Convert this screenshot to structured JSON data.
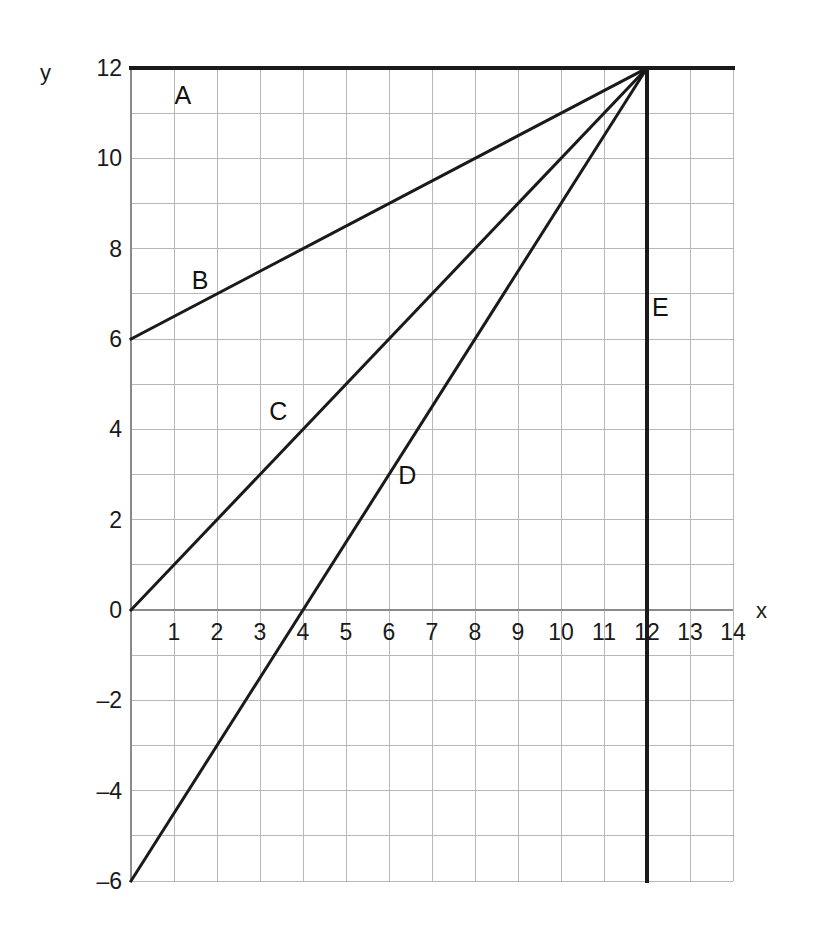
{
  "chart_data": {
    "type": "line",
    "title": "",
    "subtitle": "",
    "xlabel": "x",
    "ylabel": "y",
    "xlim": [
      0,
      14
    ],
    "ylim": [
      -6,
      12
    ],
    "grid": true,
    "grid_step_x": 1,
    "grid_step_y": 1,
    "legend_position": "inline-labels",
    "x_ticks": [
      {
        "value": 1,
        "label": "1"
      },
      {
        "value": 2,
        "label": "2"
      },
      {
        "value": 3,
        "label": "3"
      },
      {
        "value": 4,
        "label": "4"
      },
      {
        "value": 5,
        "label": "5"
      },
      {
        "value": 6,
        "label": "6"
      },
      {
        "value": 7,
        "label": "7"
      },
      {
        "value": 8,
        "label": "8"
      },
      {
        "value": 9,
        "label": "9"
      },
      {
        "value": 10,
        "label": "10"
      },
      {
        "value": 11,
        "label": "11"
      },
      {
        "value": 12,
        "label": "12"
      },
      {
        "value": 13,
        "label": "13"
      },
      {
        "value": 14,
        "label": "14"
      }
    ],
    "y_ticks": [
      {
        "value": 12,
        "label": "12"
      },
      {
        "value": 10,
        "label": "10"
      },
      {
        "value": 8,
        "label": "8"
      },
      {
        "value": 6,
        "label": "6"
      },
      {
        "value": 4,
        "label": "4"
      },
      {
        "value": 2,
        "label": "2"
      },
      {
        "value": 0,
        "label": "0"
      },
      {
        "value": -2,
        "label": "–2"
      },
      {
        "value": -4,
        "label": "–4"
      },
      {
        "value": -6,
        "label": "–6"
      }
    ],
    "series": [
      {
        "name": "A",
        "label": "A",
        "kind": "horizontal",
        "equation": "y = 12",
        "points": [
          [
            0,
            12
          ],
          [
            14,
            12
          ]
        ],
        "label_at": [
          1.2,
          11.4
        ],
        "color": "#1a1a1a",
        "width": 4
      },
      {
        "name": "B",
        "label": "B",
        "kind": "line",
        "equation": "y = 6 + 0.5x",
        "points": [
          [
            0,
            6
          ],
          [
            12,
            12
          ]
        ],
        "label_at": [
          1.6,
          7.3
        ],
        "color": "#1a1a1a",
        "width": 3
      },
      {
        "name": "C",
        "label": "C",
        "kind": "line",
        "equation": "y = x",
        "points": [
          [
            0,
            0
          ],
          [
            12,
            12
          ]
        ],
        "label_at": [
          3.4,
          4.4
        ],
        "color": "#1a1a1a",
        "width": 3
      },
      {
        "name": "D",
        "label": "D",
        "kind": "line",
        "equation": "y = -6 + 1.5x",
        "points": [
          [
            0,
            -6
          ],
          [
            12,
            12
          ]
        ],
        "label_at": [
          6.4,
          3.0
        ],
        "color": "#1a1a1a",
        "width": 3
      },
      {
        "name": "E",
        "label": "E",
        "kind": "vertical",
        "equation": "x = 12",
        "points": [
          [
            12,
            12
          ],
          [
            12,
            -6
          ]
        ],
        "label_at": [
          12.3,
          6.7
        ],
        "color": "#1a1a1a",
        "width": 4
      }
    ],
    "axis_colors": {
      "grid": "#b7b7b7",
      "axis": "#8a8a8a",
      "line": "#1a1a1a",
      "text": "#1a1a1a"
    }
  }
}
